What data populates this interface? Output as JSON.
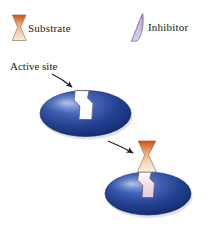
{
  "figure": {
    "background_color": "#ffffff",
    "width": 208,
    "height": 227
  },
  "legend": {
    "items": [
      {
        "key": "substrate",
        "label": "Substrate",
        "icon": "hourglass-substrate-icon",
        "colors": {
          "top": "#d4551f",
          "mid": "#e8a877",
          "bottom": "#f3e4d2",
          "outline": "#8a6a4a"
        }
      },
      {
        "key": "inhibitor",
        "label": "Inhibitor",
        "icon": "wedge-inhibitor-icon",
        "colors": {
          "top": "#8d7ab5",
          "bottom": "#d9cfe8",
          "outline": "#6d5c94"
        }
      }
    ]
  },
  "annotations": {
    "active_site": {
      "label": "Active site",
      "arrow": "pointer-arrow-icon"
    },
    "reaction_arrow": {
      "label": "",
      "arrow": "reaction-arrow-icon"
    }
  },
  "enzymes": [
    {
      "key": "free-enzyme",
      "name": "enzyme-free",
      "state": "empty active site",
      "colors": {
        "dark": "#16307a",
        "mid": "#2f50a8",
        "light": "#6f8fd0",
        "edge": "#0e1f52",
        "notch_fill": "#ffffff",
        "notch_stroke": "#4a4a6a"
      }
    },
    {
      "key": "bound-enzyme",
      "name": "enzyme-substrate-complex",
      "state": "substrate bound in active site",
      "colors": {
        "dark": "#16307a",
        "mid": "#2f50a8",
        "light": "#6f8fd0",
        "edge": "#0e1f52",
        "notch_fill": "#ffffff",
        "notch_stroke": "#4a4a6a"
      }
    }
  ],
  "bound_substrate": {
    "key": "bound-substrate",
    "name": "substrate-molecule",
    "colors": {
      "top": "#d4551f",
      "mid": "#e8a877",
      "bottom": "#f3e4d2",
      "outline": "#8a6a4a"
    }
  },
  "colors": {
    "text": "#1a1a1a",
    "arrow": "#222222",
    "enzyme_blue": "#2f50a8",
    "substrate_orange": "#d4551f",
    "inhibitor_purple": "#8d7ab5"
  }
}
